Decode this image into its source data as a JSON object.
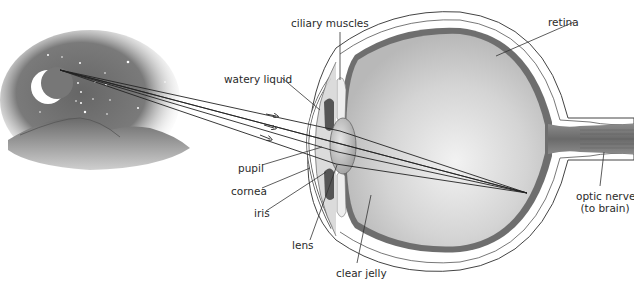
{
  "diagram": {
    "scene": {
      "description": "Night sky with crescent moon, stars and hills; light rays travel from the moon into the eye",
      "moon": "crescent",
      "ray_count": 3
    },
    "labels": {
      "ciliary_muscles": "ciliary muscles",
      "watery_liquid": "watery liquid",
      "retina": "retina",
      "pupil": "pupil",
      "cornea": "cornea",
      "iris": "iris",
      "lens": "lens",
      "clear_jelly": "clear jelly",
      "optic_nerve_line1": "optic nerve",
      "optic_nerve_line2": "(to brain)"
    },
    "colors": {
      "sky_dark": "#5a5a5a",
      "retina": "#6e6e6e",
      "eyeball_fill": "#cfcfcf",
      "outline": "#444444",
      "label_text": "#2a2a2a"
    }
  }
}
